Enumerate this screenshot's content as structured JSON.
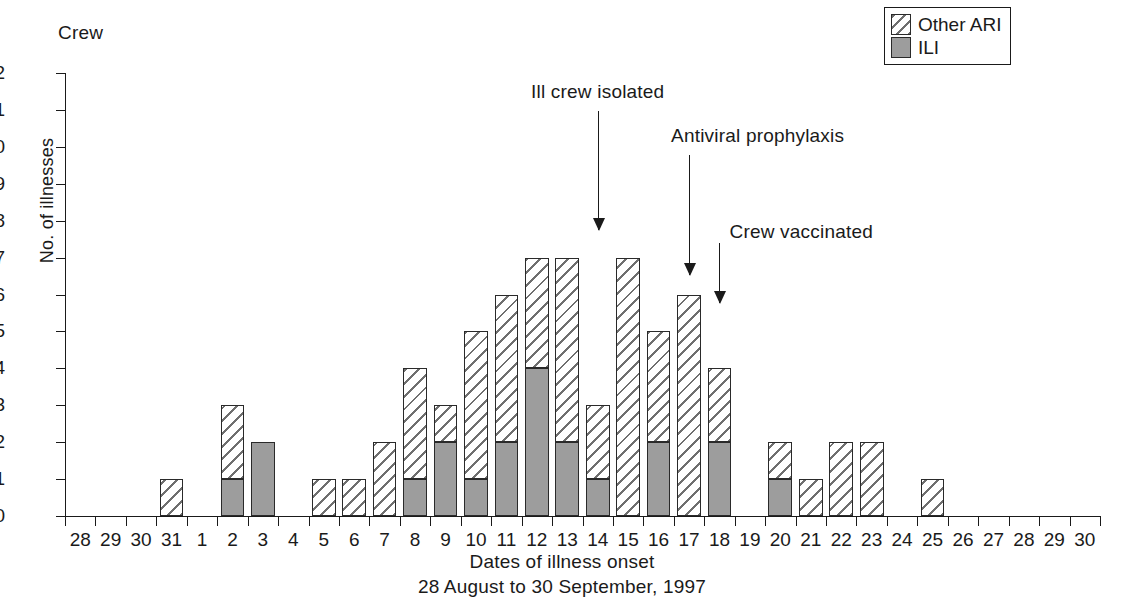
{
  "panel": {
    "title": "Crew"
  },
  "axes": {
    "ylabel": "No. of illnesses",
    "xlabel_line1": "Dates of illness onset",
    "xlabel_line2": "28 August to 30 September, 1997"
  },
  "legend": {
    "items": [
      {
        "label": "Other ARI",
        "pattern": "hatched",
        "color": "#6f6f6f"
      },
      {
        "label": "ILI",
        "pattern": "solid",
        "color": "#9d9d9d"
      }
    ]
  },
  "annotations": [
    {
      "text": "Ill crew isolated",
      "category": "14",
      "arrow_top": 111,
      "arrow_height": 119
    },
    {
      "text": "Antiviral prophylaxis",
      "category": "17",
      "arrow_top": 155,
      "arrow_height": 120
    },
    {
      "text": "Crew vaccinated",
      "category": "18",
      "arrow_top": 243,
      "arrow_height": 60
    }
  ],
  "chart_data": {
    "type": "bar",
    "subtype": "stacked-histogram",
    "title": "Crew",
    "xlabel": "Dates of illness onset / 28 August to 30 September, 1997",
    "ylabel": "No. of illnesses",
    "ylim": [
      0,
      12
    ],
    "yticks": [
      0,
      1,
      2,
      3,
      4,
      5,
      6,
      7,
      8,
      9,
      10,
      11,
      12
    ],
    "grid": false,
    "legend_position": "top-right",
    "categories": [
      "28",
      "29",
      "30",
      "31",
      "1",
      "2",
      "3",
      "4",
      "5",
      "6",
      "7",
      "8",
      "9",
      "10",
      "11",
      "12",
      "13",
      "14",
      "15",
      "16",
      "17",
      "18",
      "19",
      "20",
      "21",
      "22",
      "23",
      "24",
      "25",
      "26",
      "27",
      "28",
      "29",
      "30"
    ],
    "series": [
      {
        "name": "ILI",
        "values": [
          0,
          0,
          0,
          0,
          0,
          1,
          2,
          0,
          0,
          0,
          0,
          1,
          2,
          1,
          2,
          4,
          2,
          1,
          0,
          2,
          0,
          2,
          0,
          1,
          0,
          0,
          0,
          0,
          0,
          0,
          0,
          0,
          0,
          0
        ]
      },
      {
        "name": "Other ARI",
        "values": [
          0,
          0,
          0,
          1,
          0,
          2,
          0,
          0,
          1,
          1,
          2,
          3,
          1,
          4,
          4,
          3,
          5,
          2,
          7,
          3,
          6,
          2,
          0,
          1,
          1,
          2,
          2,
          0,
          1,
          0,
          0,
          0,
          0,
          0
        ]
      }
    ],
    "totals": [
      0,
      0,
      0,
      1,
      0,
      3,
      2,
      0,
      1,
      1,
      2,
      4,
      3,
      5,
      6,
      7,
      7,
      3,
      7,
      5,
      6,
      4,
      0,
      2,
      1,
      2,
      2,
      0,
      1,
      0,
      0,
      0,
      0,
      0
    ]
  }
}
